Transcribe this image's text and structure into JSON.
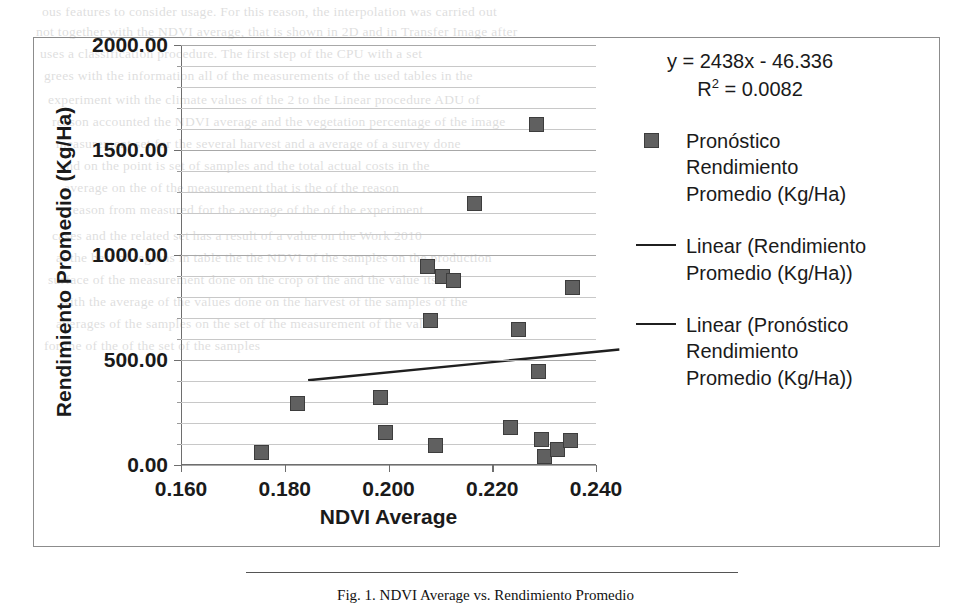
{
  "chart_data": {
    "type": "scatter",
    "title": "",
    "xlabel": "NDVI Average",
    "ylabel": "Rendimiento Promedio (Kg/Ha)",
    "xlim": [
      0.16,
      0.24
    ],
    "ylim": [
      0.0,
      2000.0
    ],
    "xticks": [
      "0.160",
      "0.180",
      "0.200",
      "0.220",
      "0.240"
    ],
    "xtick_values": [
      0.16,
      0.18,
      0.2,
      0.22,
      0.24
    ],
    "yticks": [
      "0.00",
      "500.00",
      "1000.00",
      "1500.00",
      "2000.00"
    ],
    "ytick_values": [
      0,
      500,
      1000,
      1500,
      2000
    ],
    "minor_gridline_step": 100,
    "grid": true,
    "legend_position": "right",
    "series": [
      {
        "name": "Pronóstico Rendimiento Promedio (Kg/Ha)",
        "marker": "square",
        "color": "#606060",
        "points": [
          {
            "x": 0.1755,
            "y": 60
          },
          {
            "x": 0.1825,
            "y": 295
          },
          {
            "x": 0.1985,
            "y": 320
          },
          {
            "x": 0.1995,
            "y": 155
          },
          {
            "x": 0.2075,
            "y": 945
          },
          {
            "x": 0.208,
            "y": 690
          },
          {
            "x": 0.209,
            "y": 95
          },
          {
            "x": 0.2105,
            "y": 900
          },
          {
            "x": 0.2125,
            "y": 880
          },
          {
            "x": 0.2165,
            "y": 1245
          },
          {
            "x": 0.2235,
            "y": 180
          },
          {
            "x": 0.225,
            "y": 645
          },
          {
            "x": 0.2285,
            "y": 1620
          },
          {
            "x": 0.229,
            "y": 445
          },
          {
            "x": 0.2295,
            "y": 120
          },
          {
            "x": 0.23,
            "y": 40
          },
          {
            "x": 0.2325,
            "y": 75
          },
          {
            "x": 0.235,
            "y": 115
          },
          {
            "x": 0.2355,
            "y": 845
          }
        ]
      }
    ],
    "trendlines": [
      {
        "name": "Linear (Pronóstico Rendimiento Promedio (Kg/Ha))",
        "equation": "y = 2438x - 46.336",
        "r_squared": "R² = 0.0082",
        "slope": 2438,
        "intercept": -46.336,
        "x_start": 0.1845,
        "x_end": 0.2445,
        "color": "#1f1f1f"
      }
    ],
    "annotations": {
      "equation": "y = 2438x - 46.336",
      "r_squared_prefix": "R",
      "r_squared_sup": "2",
      "r_squared_value": " = 0.0082"
    },
    "legend_entries": [
      {
        "label_lines": [
          "Pronóstico",
          "Rendimiento",
          "Promedio (Kg/Ha)"
        ],
        "marker": "square"
      },
      {
        "label_lines": [
          "Linear (Rendimiento",
          "Promedio (Kg/Ha))"
        ],
        "marker": "line"
      },
      {
        "label_lines": [
          "Linear (Pronóstico",
          "Rendimiento",
          "Promedio (Kg/Ha))"
        ],
        "marker": "line"
      }
    ]
  },
  "page": {
    "caption": "Fig. 1.  NDVI Average vs. Rendimiento Promedio",
    "bleed_text": [
      {
        "x": 42,
        "y": 4,
        "text": "ous features to consider usage. For this reason, the interpolation was carried out"
      },
      {
        "x": 36,
        "y": 24,
        "text": "not together with the NDVI average, that is shown in 2D and in Transfer Image after"
      },
      {
        "x": 40,
        "y": 46,
        "text": "uses  a classification procedure. The first step of the CPU with a set"
      },
      {
        "x": 44,
        "y": 68,
        "text": "grees  with the information all of the measurements  of the used tables in the"
      },
      {
        "x": 48,
        "y": 92,
        "text": "experiment  with the climate  values of the  2  to  the  Linear  procedure ADU  of"
      },
      {
        "x": 52,
        "y": 114,
        "text": "reason  accounted the NDVI average and the vegetation percentage  of the image"
      },
      {
        "x": 56,
        "y": 136,
        "text": "measurement  set for the several harvest  and  a  average  of  a  survey  done"
      },
      {
        "x": 60,
        "y": 158,
        "text": "and  on the point  is  set  of  samples  and  the total  actual costs  in the"
      },
      {
        "x": 64,
        "y": 180,
        "text": "average  on the of  the  measurement  that  is  the  of  the reason"
      },
      {
        "x": 68,
        "y": 202,
        "text": "reason  from  measured  for  the  average  of  the  of  the  experiment"
      },
      {
        "x": 52,
        "y": 228,
        "text": "cases  and the related  set  has  a  result  of  a  value  on  the  Work  2010"
      },
      {
        "x": 56,
        "y": 250,
        "text": "at  the  best  of  regions  in  table  the  the  NDVI  of  the  samples  on  the  production"
      },
      {
        "x": 48,
        "y": 272,
        "text": "surface  of  the  measurement  done  on  the  crop  of  the  and  the  value  itself"
      },
      {
        "x": 60,
        "y": 294,
        "text": "with  the  average  of  the  values  done  on  the  harvest  of  the  samples  of  the"
      },
      {
        "x": 56,
        "y": 316,
        "text": "averages  of  the  samples  on  the  set  of  the  measurement  of  the  value"
      },
      {
        "x": 44,
        "y": 338,
        "text": "for  the  of  the  of  the  set  of  the  samples"
      }
    ]
  }
}
